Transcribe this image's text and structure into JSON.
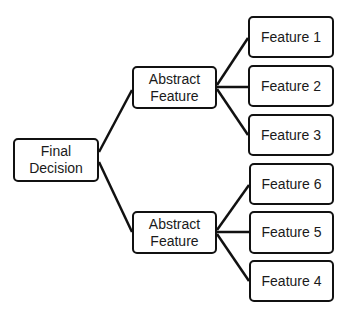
{
  "diagram": {
    "type": "tree",
    "root": {
      "id": "final",
      "label": "Final\nDecision"
    },
    "nodes": [
      {
        "id": "final",
        "label": "Final\nDecision",
        "x": 13,
        "y": 138,
        "w": 86,
        "h": 44
      },
      {
        "id": "abs1",
        "label": "Abstract\nFeature",
        "x": 132,
        "y": 66,
        "w": 85,
        "h": 43
      },
      {
        "id": "abs2",
        "label": "Abstract\nFeature",
        "x": 132,
        "y": 211,
        "w": 85,
        "h": 43
      },
      {
        "id": "f1",
        "label": "Feature 1",
        "x": 248,
        "y": 16,
        "w": 86,
        "h": 42
      },
      {
        "id": "f2",
        "label": "Feature 2",
        "x": 248,
        "y": 65,
        "w": 86,
        "h": 42
      },
      {
        "id": "f3",
        "label": "Feature 3",
        "x": 248,
        "y": 114,
        "w": 86,
        "h": 42
      },
      {
        "id": "f6",
        "label": "Feature 6",
        "x": 249,
        "y": 163,
        "w": 85,
        "h": 42
      },
      {
        "id": "f5",
        "label": "Feature 5",
        "x": 249,
        "y": 211,
        "w": 85,
        "h": 43
      },
      {
        "id": "f4",
        "label": "Feature 4",
        "x": 249,
        "y": 260,
        "w": 85,
        "h": 42
      }
    ],
    "edges": [
      {
        "from": "final",
        "to": "abs1",
        "x1": 99,
        "y1": 152,
        "x2": 132,
        "y2": 90
      },
      {
        "from": "final",
        "to": "abs2",
        "x1": 99,
        "y1": 162,
        "x2": 132,
        "y2": 232
      },
      {
        "from": "abs1",
        "to": "f1",
        "x1": 217,
        "y1": 85,
        "x2": 248,
        "y2": 38
      },
      {
        "from": "abs1",
        "to": "f2",
        "x1": 217,
        "y1": 87,
        "x2": 248,
        "y2": 87
      },
      {
        "from": "abs1",
        "to": "f3",
        "x1": 217,
        "y1": 89,
        "x2": 248,
        "y2": 135
      },
      {
        "from": "abs2",
        "to": "f6",
        "x1": 217,
        "y1": 230,
        "x2": 249,
        "y2": 185
      },
      {
        "from": "abs2",
        "to": "f5",
        "x1": 217,
        "y1": 232,
        "x2": 249,
        "y2": 232
      },
      {
        "from": "abs2",
        "to": "f4",
        "x1": 217,
        "y1": 234,
        "x2": 249,
        "y2": 281
      }
    ],
    "colors": {
      "stroke": "#111111",
      "fill": "#ffffff",
      "text": "#1a1a1a"
    }
  }
}
